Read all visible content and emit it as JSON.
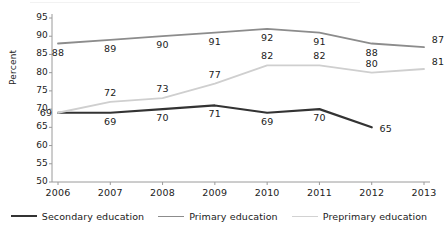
{
  "chart_data": {
    "type": "line",
    "title": "",
    "xlabel": "",
    "ylabel": "Percent",
    "categories": [
      "2006",
      "2007",
      "2008",
      "2009",
      "2010",
      "2011",
      "2012",
      "2013"
    ],
    "ylim": [
      50,
      95
    ],
    "yticks": [
      "50",
      "55",
      "60",
      "65",
      "70",
      "75",
      "80",
      "85",
      "90",
      "95"
    ],
    "grid": false,
    "legend_position": "bottom",
    "series": [
      {
        "name": "Secondary education",
        "color": "#333333",
        "width": 2.2,
        "values": [
          69,
          69,
          70,
          71,
          69,
          70,
          65,
          null
        ],
        "labels": [
          "69",
          "69",
          "70",
          "71",
          "69",
          "70",
          "65",
          ""
        ],
        "label_side": "below"
      },
      {
        "name": "Primary education",
        "color": "#8c8c8c",
        "width": 1.8,
        "values": [
          88,
          89,
          90,
          91,
          92,
          91,
          88,
          87
        ],
        "labels": [
          "88",
          "89",
          "90",
          "91",
          "92",
          "91",
          "88",
          "87"
        ],
        "label_side": "below"
      },
      {
        "name": "Preprimary education",
        "color": "#cfcfcf",
        "width": 1.8,
        "values": [
          69,
          72,
          73,
          77,
          82,
          82,
          80,
          81
        ],
        "labels": [
          "69",
          "72",
          "73",
          "77",
          "82",
          "82",
          "80",
          "81"
        ],
        "label_side": "above"
      }
    ]
  },
  "axis": {
    "y_title": "Percent",
    "yticks": [
      "95",
      "90",
      "85",
      "80",
      "75",
      "70",
      "65",
      "60",
      "55",
      "50"
    ],
    "xticks": [
      "2006",
      "2007",
      "2008",
      "2009",
      "2010",
      "2011",
      "2012",
      "2013"
    ]
  },
  "legend": {
    "items": [
      {
        "label": "Secondary education",
        "color": "#333333",
        "thickness": "2.4px"
      },
      {
        "label": "Primary education",
        "color": "#8c8c8c",
        "thickness": "1.8px"
      },
      {
        "label": "Preprimary education",
        "color": "#d2d2d2",
        "thickness": "1.8px"
      }
    ]
  }
}
